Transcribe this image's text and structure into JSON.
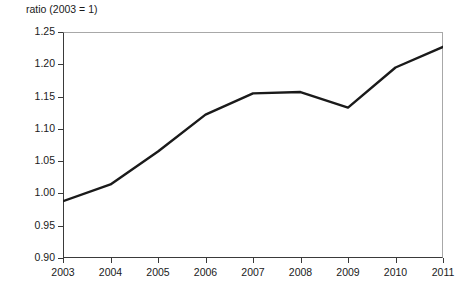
{
  "chart_data": {
    "type": "line",
    "title": "",
    "subtitle": "",
    "ylabel": "ratio (2003 = 1)",
    "xlabel": "",
    "categories": [
      "2003",
      "2004",
      "2005",
      "2006",
      "2007",
      "2008",
      "2009",
      "2010",
      "2011"
    ],
    "x": [
      2003,
      2004,
      2005,
      2006,
      2007,
      2008,
      2009,
      2010,
      2011
    ],
    "values": [
      0.988,
      1.014,
      1.065,
      1.122,
      1.155,
      1.157,
      1.133,
      1.195,
      1.227
    ],
    "series": [
      {
        "name": "ratio (2003 = 1)",
        "values": [
          0.988,
          1.014,
          1.065,
          1.122,
          1.155,
          1.157,
          1.133,
          1.195,
          1.227
        ]
      }
    ],
    "ylim": [
      0.9,
      1.25
    ],
    "xlim": [
      2003,
      2011
    ],
    "y_ticks": [
      0.9,
      0.95,
      1.0,
      1.05,
      1.1,
      1.15,
      1.2,
      1.25
    ],
    "y_tick_labels": [
      "0.90",
      "0.95",
      "1.00",
      "1.05",
      "1.10",
      "1.15",
      "1.20",
      "1.25"
    ],
    "x_ticks": [
      2003,
      2004,
      2005,
      2006,
      2007,
      2008,
      2009,
      2010,
      2011
    ],
    "x_tick_labels": [
      "2003",
      "2004",
      "2005",
      "2006",
      "2007",
      "2008",
      "2009",
      "2010",
      "2011"
    ],
    "grid": false,
    "legend": false,
    "legend_position": "none",
    "line_color": "#1a1a1a",
    "line_width": 2.4,
    "background_color": "#ffffff",
    "axis_color": "#3a3a3a",
    "annotations": []
  }
}
